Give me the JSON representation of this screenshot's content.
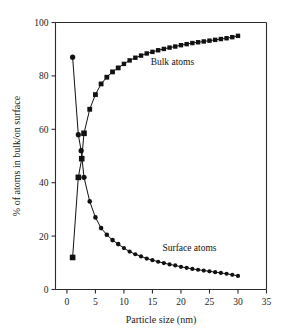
{
  "chart_data": {
    "type": "line",
    "title": "",
    "xlabel": "Particle size (nm)",
    "ylabel": "% of atoms in bulk/on surface",
    "xlim": [
      -2,
      35
    ],
    "ylim": [
      0,
      100
    ],
    "xticks": [
      0,
      5,
      10,
      15,
      20,
      25,
      30,
      35
    ],
    "xtick_labels": [
      "0",
      "5",
      "10",
      "15",
      "20",
      "25",
      "30",
      "35"
    ],
    "yticks": [
      0,
      20,
      40,
      60,
      80,
      100
    ],
    "ytick_labels": [
      "0",
      "20",
      "40",
      "60",
      "80",
      "100"
    ],
    "grid": false,
    "legend": "annotations",
    "series": [
      {
        "name": "Surface atoms",
        "marker": "circle",
        "label_x": 21.5,
        "label_y": 14.5,
        "x": [
          1,
          2,
          2.5,
          3,
          4,
          5,
          6,
          7,
          8,
          9,
          10,
          11,
          12,
          13,
          14,
          15,
          16,
          17,
          18,
          19,
          20,
          21,
          22,
          23,
          24,
          25,
          26,
          27,
          28,
          29,
          30
        ],
        "values": [
          87,
          58,
          52,
          42,
          33,
          27,
          23,
          20.5,
          18.5,
          17,
          15.5,
          14.2,
          13.2,
          12.4,
          11.6,
          11,
          10.4,
          9.9,
          9.4,
          9,
          8.5,
          8.1,
          7.7,
          7.4,
          7.1,
          6.8,
          6.5,
          6.2,
          5.9,
          5.5,
          5.1
        ]
      },
      {
        "name": "Bulk atoms",
        "marker": "square",
        "label_x": 18.5,
        "label_y": 84,
        "x": [
          1,
          2,
          2.6,
          3,
          4,
          5,
          6,
          7,
          8,
          9,
          10,
          11,
          12,
          13,
          14,
          15,
          16,
          17,
          18,
          19,
          20,
          21,
          22,
          23,
          24,
          25,
          26,
          27,
          28,
          29,
          30
        ],
        "values": [
          12,
          42,
          49,
          58.5,
          67.5,
          73,
          77,
          79.5,
          81.5,
          83,
          84.5,
          85.8,
          86.8,
          87.6,
          88.4,
          89,
          89.6,
          90.1,
          90.6,
          91,
          91.5,
          91.9,
          92.3,
          92.6,
          92.9,
          93.2,
          93.5,
          93.8,
          94.1,
          94.5,
          95
        ]
      }
    ]
  }
}
